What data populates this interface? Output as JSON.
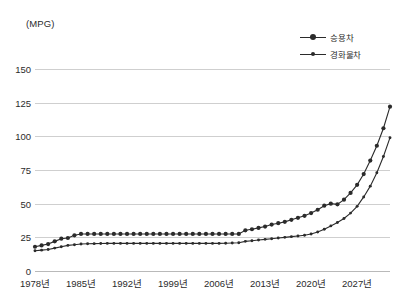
{
  "axis_unit_label": "(MPG)",
  "legend": {
    "position": "top-right",
    "items": [
      {
        "label": "승용차",
        "marker": "circle-large",
        "color": "#2b2b2b"
      },
      {
        "label": "경화물차",
        "marker": "circle-small",
        "color": "#2b2b2b"
      }
    ]
  },
  "chart_data": {
    "type": "line",
    "title": "",
    "subtitle": "",
    "xlabel": "",
    "ylabel": "(MPG)",
    "ylim": [
      0,
      150
    ],
    "xlim": [
      1978,
      2032
    ],
    "grid": true,
    "legend_position": "top-right",
    "ytick_labels": [
      "150",
      "125",
      "100",
      "75",
      "50",
      "25",
      "0"
    ],
    "ytick_values": [
      150,
      125,
      100,
      75,
      50,
      25,
      0
    ],
    "xtick_labels": [
      "1978년",
      "1985년",
      "1992년",
      "1999년",
      "2006년",
      "2013년",
      "2020년",
      "2027년"
    ],
    "xtick_values": [
      1978,
      1985,
      1992,
      1999,
      2006,
      2013,
      2020,
      2027
    ],
    "x": [
      1978,
      1979,
      1980,
      1981,
      1982,
      1983,
      1984,
      1985,
      1986,
      1987,
      1988,
      1989,
      1990,
      1991,
      1992,
      1993,
      1994,
      1995,
      1996,
      1997,
      1998,
      1999,
      2000,
      2001,
      2002,
      2003,
      2004,
      2005,
      2006,
      2007,
      2008,
      2009,
      2010,
      2011,
      2012,
      2013,
      2014,
      2015,
      2016,
      2017,
      2018,
      2019,
      2020,
      2021,
      2022,
      2023,
      2024,
      2025,
      2026,
      2027,
      2028,
      2029,
      2030,
      2031,
      2032
    ],
    "series": [
      {
        "name": "승용차",
        "color": "#2b2b2b",
        "marker": "circle-large",
        "values": [
          18.0,
          19.0,
          20.0,
          22.0,
          24.0,
          24.5,
          26.5,
          27.5,
          27.5,
          27.5,
          27.5,
          27.5,
          27.5,
          27.5,
          27.5,
          27.5,
          27.5,
          27.5,
          27.5,
          27.5,
          27.5,
          27.5,
          27.5,
          27.5,
          27.5,
          27.5,
          27.5,
          27.5,
          27.5,
          27.5,
          27.5,
          27.5,
          30.2,
          31.0,
          32.0,
          33.0,
          34.5,
          35.5,
          36.5,
          38.0,
          39.5,
          41.0,
          43.0,
          45.5,
          48.5,
          50.0,
          49.5,
          53.0,
          58.0,
          64.0,
          72.0,
          82.0,
          93.0,
          106.0,
          122.0
        ]
      },
      {
        "name": "경화물차",
        "color": "#2b2b2b",
        "marker": "circle-small",
        "values": [
          15.0,
          15.5,
          16.0,
          17.0,
          18.0,
          19.0,
          19.5,
          20.0,
          20.2,
          20.3,
          20.4,
          20.5,
          20.5,
          20.5,
          20.5,
          20.5,
          20.5,
          20.5,
          20.5,
          20.5,
          20.5,
          20.5,
          20.5,
          20.5,
          20.5,
          20.5,
          20.5,
          20.5,
          20.5,
          20.6,
          20.8,
          21.0,
          22.0,
          22.5,
          23.0,
          23.5,
          24.0,
          24.5,
          25.0,
          25.5,
          26.0,
          26.5,
          27.5,
          29.0,
          31.0,
          33.5,
          36.0,
          39.0,
          43.0,
          48.0,
          55.0,
          63.0,
          73.0,
          85.0,
          99.0
        ]
      }
    ]
  }
}
